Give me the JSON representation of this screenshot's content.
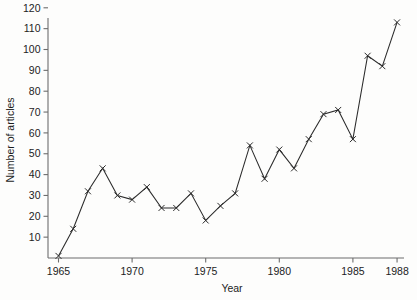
{
  "chart_data": {
    "type": "line",
    "title": "",
    "xlabel": "Year",
    "ylabel": "Number of articles",
    "xlim": [
      1964,
      1988.6
    ],
    "ylim": [
      0,
      125
    ],
    "grid": false,
    "legend": null,
    "marker": "x",
    "x": [
      1965,
      1966,
      1967,
      1968,
      1969,
      1970,
      1971,
      1972,
      1973,
      1974,
      1975,
      1976,
      1977,
      1978,
      1979,
      1980,
      1981,
      1982,
      1983,
      1984,
      1985,
      1986,
      1987,
      1988
    ],
    "values": [
      1,
      14,
      32,
      43,
      30,
      28,
      34,
      24,
      24,
      31,
      18,
      25,
      31,
      54,
      38,
      52,
      43,
      57,
      69,
      71,
      57,
      97,
      92,
      113
    ],
    "series": [
      {
        "name": "Number of articles",
        "values": [
          1,
          14,
          32,
          43,
          30,
          28,
          34,
          24,
          24,
          31,
          18,
          25,
          31,
          54,
          38,
          52,
          43,
          57,
          69,
          71,
          57,
          97,
          92,
          113
        ]
      }
    ],
    "ytick_labels": [
      "10",
      "20",
      "30",
      "40",
      "50",
      "60",
      "70",
      "80",
      "90",
      "100",
      "110",
      "120"
    ],
    "ytick_values": [
      10,
      20,
      30,
      40,
      50,
      60,
      70,
      80,
      90,
      100,
      110,
      120
    ],
    "xtick_labels": [
      "1965",
      "1970",
      "1975",
      "1980",
      "1985",
      "1988"
    ],
    "xtick_values": [
      1965,
      1970,
      1975,
      1980,
      1985,
      1988
    ],
    "line_color": "#2b2b2b",
    "axis_color": "#6d6d6d",
    "background_color": "#fdfdfc"
  }
}
